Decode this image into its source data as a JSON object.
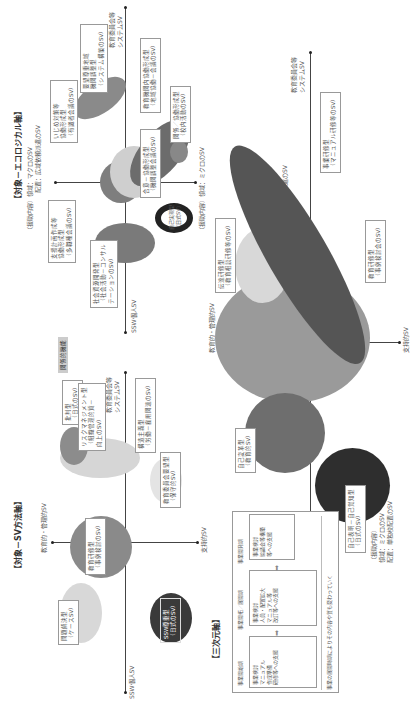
{
  "sv_method": {
    "title": "【対象－SV方法軸】",
    "axis_top": "教育的・管理的SV",
    "axis_bottom": "支持的SV",
    "axis_left": "SSW個人SV",
    "axis_right": "教育委員会等\nシステムSV",
    "tag_label": "関係的機能",
    "boxes": [
      {
        "line1": "問題解決型",
        "line2": "（ケースSV）"
      },
      {
        "line1": "教育研修型",
        "line2": "（事例検討のSV）"
      },
      {
        "line1": "SSW尊重型",
        "line2": "（日式のSV）"
      },
      {
        "line1": "批判型",
        "line2": "（日式のSV）"
      },
      {
        "line1": "リスクマネジメント型",
        "line2": "（組織管理的質－",
        "line3": "向上のSV）"
      },
      {
        "line1": "構造主義型",
        "line2": "（労働－雇用関連のSV）"
      },
      {
        "line1": "教育委員会要望型",
        "line2": "（保守的SV）"
      }
    ]
  },
  "ecological": {
    "title": "【対象－エコロジカル軸】",
    "axis_top_1": "（援助内容）領域：マクロのSV",
    "axis_top_2": "配置：広域依頼派遣のSV",
    "axis_bottom": "（援助内容）領域：ミクロのSV",
    "axis_left": "SSW個人SV",
    "axis_right": "教育委員会等\nシステムSV",
    "boxes": [
      {
        "line1": "いじめ対策等",
        "line2": "協働形成型",
        "line3": "（有識者会議のSV）"
      },
      {
        "line1": "要望尊重地域",
        "line2": "機関調整型",
        "line3": "（システム構築のSV）"
      },
      {
        "line1": "教育機関内協働形成型",
        "line2": "（地域協働－会議のSV）"
      },
      {
        "line1": "支援計画作成等",
        "line2": "協働形成型",
        "line3": "（多職種会議のSV）"
      },
      {
        "line1": "社会資源開発型",
        "line2": "（社会活動－コンサル",
        "line3": "テーションのSV）"
      },
      {
        "line1": "合意－協働形成型",
        "line2": "（機関調整会議のSV）"
      },
      {
        "line1": "自己実現型",
        "line2": "（日式SV）"
      },
      {
        "line1": "関係／協働形成型",
        "line2": "（校内活動のSV）"
      }
    ]
  },
  "three_dim": {
    "title": "【三次元軸】",
    "axis_top": "教育的・管理的SV",
    "axis_bottom": "支持的SV",
    "axis_left": "SSW個人SV",
    "axis_right": "教育委員会等\nシステムSV",
    "macro_1": "（援助内容）",
    "macro_2": "領域：マクロのSV",
    "macro_3": "配置：広域依頼派遣のSV",
    "micro_1": "（援助内容）",
    "micro_2": "領域：ミクロのSV",
    "micro_3": "配置：単独校配置のSV",
    "boxes": [
      {
        "line1": "伝達研修型",
        "line2": "（教育相談研修等のSV）"
      },
      {
        "line1": "事業研修型",
        "line2": "（マニュアル研修等のSV）"
      },
      {
        "line1": "教育研修型",
        "line2": "（事例検討会のSV）"
      },
      {
        "line1": "自己変革型",
        "line2": "（教育的SV）"
      },
      {
        "line1": "自己表明－自己覚知型",
        "line2": "（日式のSV）"
      }
    ]
  },
  "flow": {
    "headers": [
      "事業開始期",
      "事業開拓／展開期",
      "事業開発期"
    ],
    "steps": [
      {
        "line1": "事業検討",
        "line2": "マニュアル",
        "line3": "作成準備",
        "line4": "研修等への支援"
      },
      {
        "line1": "事業検討",
        "line2": "人員・配置拡大",
        "line3": "マニュアル等",
        "line4": "改訂等への支援"
      },
      {
        "line1": "事業検討",
        "line2": "協議会等構築",
        "line3": "等への支援"
      }
    ],
    "footer": "事業の展開時期によりその内容や質も変わっていく"
  }
}
